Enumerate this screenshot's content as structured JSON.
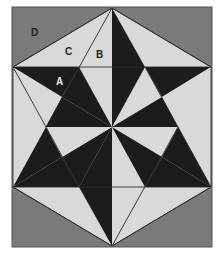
{
  "figure": {
    "colors": {
      "corner_fill": "#7a7a7a",
      "light_fill": "#d9d9d9",
      "dark_fill": "#1c1c1c",
      "line": "#2a2a2a",
      "frame_border": "#555555"
    },
    "labels": {
      "A": "A",
      "B": "B",
      "C": "C",
      "D": "D"
    }
  }
}
